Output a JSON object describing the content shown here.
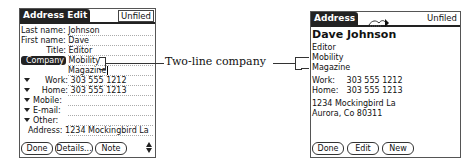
{
  "left_screen": {
    "title": "Address Edit",
    "category": "Unfiled",
    "fields": [
      {
        "label": "Last name:",
        "value": "Johnson"
      },
      {
        "label": "First name:",
        "value": "Dave"
      },
      {
        "label": "Title:",
        "value": "Editor"
      },
      {
        "label": "Company",
        "value": "Mobility",
        "value2": "Magazine"
      },
      {
        "label": "Work:",
        "value": "303 555 1212",
        "dropdown": true
      },
      {
        "label": "Home:",
        "value": "303 555 1213",
        "dropdown": true
      },
      {
        "label": "Mobile:",
        "value": "",
        "dropdown": true
      },
      {
        "label": "E-mail:",
        "value": "",
        "dropdown": true
      },
      {
        "label": "Other:",
        "value": "",
        "dropdown": true
      },
      {
        "label": "Address:",
        "value": "1234 Mockingbird La"
      }
    ],
    "buttons": [
      "Done",
      "Details...",
      "Note"
    ],
    "scroll_icon": "scroll-arrows-icon"
  },
  "callout": {
    "label": "Two-line company"
  },
  "right_screen": {
    "title": "Address",
    "category": "Unfiled",
    "beam_icon": "beam-icon",
    "name": "Dave Johnson",
    "title_line": "Editor",
    "company_line1": "Mobility",
    "company_line2": "Magazine",
    "phones": [
      {
        "label": "Work:",
        "value": "303 555 1212"
      },
      {
        "label": "Home:",
        "value": "303 555 1213"
      }
    ],
    "address_line1": "1234 Mockingbird La",
    "address_line2": "Aurora, Co  80311",
    "buttons": [
      "Done",
      "Edit",
      "New"
    ]
  }
}
